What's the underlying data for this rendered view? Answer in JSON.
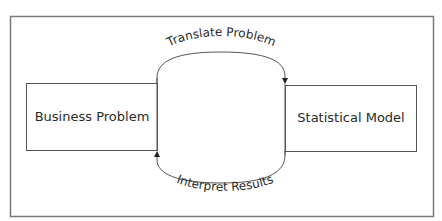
{
  "diagram": {
    "nodes": [
      {
        "id": "business",
        "label": "Business Problem"
      },
      {
        "id": "statistical",
        "label": "Statistical Model"
      }
    ],
    "edges": [
      {
        "from": "business",
        "to": "statistical",
        "label": "Translate Problem"
      },
      {
        "from": "statistical",
        "to": "business",
        "label": "Interpret Results"
      }
    ],
    "colors": {
      "stroke": "#555555",
      "frame": "#777777",
      "text": "#2a2a2a",
      "background": "#ffffff"
    }
  }
}
